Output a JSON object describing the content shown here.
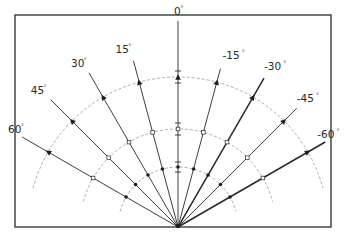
{
  "diagram": {
    "frame": {
      "x": 15,
      "y": 15,
      "width": 316,
      "height": 212
    },
    "origin": {
      "x": 178,
      "y": 227
    },
    "arcs": [
      {
        "name": "outer-arc",
        "radius": 150
      },
      {
        "name": "middle-arc",
        "radius": 98
      },
      {
        "name": "inner-arc",
        "radius": 60
      }
    ],
    "rays": [
      {
        "angle": 0,
        "label": "0",
        "length": 206,
        "label_dx": -4,
        "label_dy": -6,
        "bold": false
      },
      {
        "angle": 15,
        "label": "15",
        "length": 172,
        "label_dx": -18,
        "label_dy": -8,
        "bold": false
      },
      {
        "angle": 30,
        "label": "30",
        "length": 178,
        "label_dx": -18,
        "label_dy": -6,
        "bold": false
      },
      {
        "angle": 45,
        "label": "45",
        "length": 180,
        "label_dx": -20,
        "label_dy": -6,
        "bold": false
      },
      {
        "angle": 60,
        "label": "60",
        "length": 180,
        "label_dx": -14,
        "label_dy": -4,
        "bold": false
      },
      {
        "angle": -15,
        "label": "-15",
        "length": 164,
        "label_dx": 2,
        "label_dy": -10,
        "bold": false
      },
      {
        "angle": -30,
        "label": "-30",
        "length": 172,
        "label_dx": 0,
        "label_dy": -8,
        "bold": true
      },
      {
        "angle": -45,
        "label": "-45",
        "length": 168,
        "label_dx": 0,
        "label_dy": -6,
        "bold": false
      },
      {
        "angle": -60,
        "label": "-60",
        "length": 170,
        "label_dx": -8,
        "label_dy": -4,
        "bold": true
      }
    ],
    "degree_symbol": "°",
    "marker_types": [
      "triangle-outer",
      "square-middle",
      "dot-inner"
    ]
  }
}
